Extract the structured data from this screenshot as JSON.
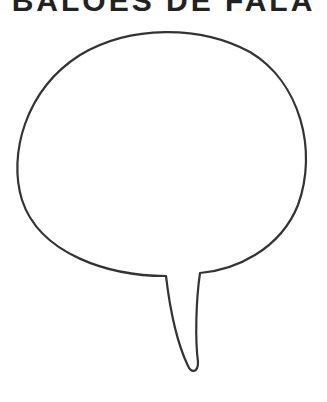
{
  "title": "BALÕES DE FALA",
  "bubble": {
    "type": "speech-bubble",
    "fill": "#ffffff",
    "stroke": "#333333",
    "content": ""
  }
}
